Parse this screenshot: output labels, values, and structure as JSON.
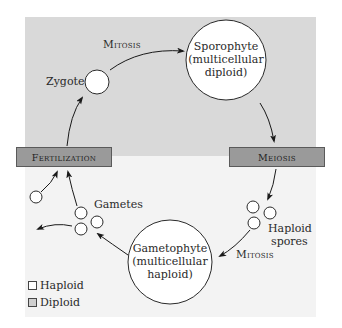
{
  "diagram": {
    "colors": {
      "diploid_region": "#d9d9d9",
      "haploid_region": "#f3f3f3",
      "stage_box": "#9a9a9a",
      "circle_fill": "#ffffff",
      "stroke": "#2a2a2a"
    },
    "stages": {
      "fertilization": "Fertilization",
      "meiosis": "Meiosis"
    },
    "processes": {
      "mitosis_top": "Mitosis",
      "mitosis_bottom": "Mitosis"
    },
    "nodes": {
      "zygote": "Zygote",
      "sporophyte": {
        "line1": "Sporophyte",
        "line2": "(multicellular",
        "line3": "diploid)"
      },
      "gametophyte": {
        "line1": "Gametophyte",
        "line2": "(multicellular",
        "line3": "haploid)"
      },
      "gametes": "Gametes",
      "spores": {
        "line1": "Haploid",
        "line2": "spores"
      }
    },
    "legend": [
      {
        "label": "Haploid",
        "color": "#ffffff"
      },
      {
        "label": "Diploid",
        "color": "#cfcfcf"
      }
    ]
  }
}
